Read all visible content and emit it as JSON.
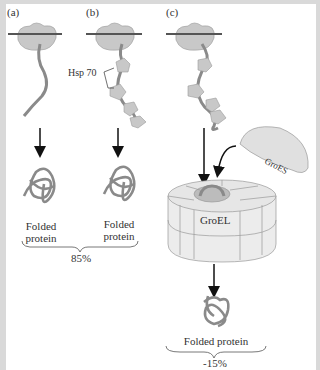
{
  "panels": [
    {
      "id": "a",
      "label": "(a)",
      "result": "Folded\nprotein"
    },
    {
      "id": "b",
      "label": "(b)",
      "chaperone": "Hsp 70",
      "result": "Folded\nprotein"
    },
    {
      "id": "c",
      "label": "(c)",
      "chaperonin": "GroEL",
      "cochaperonin": "GroES",
      "result": "Folded protein"
    }
  ],
  "labels": {
    "a_tag": "(a)",
    "b_tag": "(b)",
    "c_tag": "(c)",
    "hsp70": "Hsp 70",
    "groel": "GroEL",
    "groes": "GroES",
    "folded_a_1": "Folded",
    "folded_a_2": "protein",
    "folded_b_1": "Folded",
    "folded_b_2": "protein",
    "folded_c": "Folded protein",
    "percent_ab": "85%",
    "percent_c": "-15%"
  },
  "colors": {
    "ribosome": "#c8c8c8",
    "chain": "#8a8a8a",
    "membrane_bar": "#555555",
    "background": "#ffffff",
    "border": "#d9d9d9"
  }
}
